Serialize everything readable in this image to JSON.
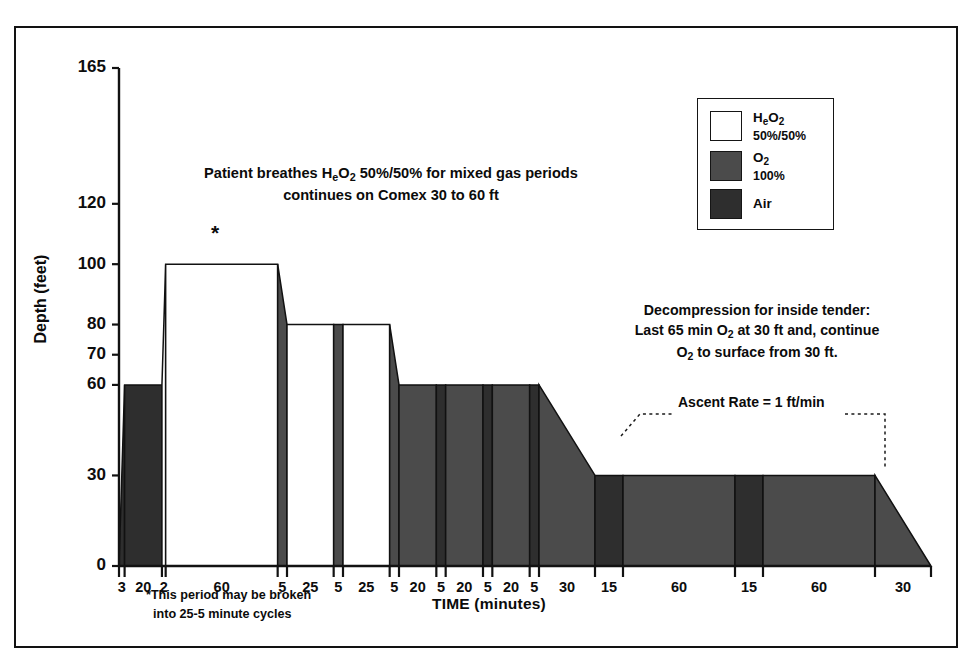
{
  "figure": {
    "background": "#ffffff",
    "border_color": "#121212"
  },
  "axes": {
    "y_title": "Depth (feet)",
    "x_title": "TIME (minutes)",
    "y_ticks": [
      0,
      30,
      60,
      70,
      80,
      100,
      120,
      165
    ],
    "y_min": 0,
    "y_max": 165
  },
  "legend": {
    "items": [
      {
        "name": "HeO2",
        "label_main": "H",
        "label_sub": "e",
        "label_main2": "O",
        "label_sub2": "2",
        "percent": "50%/50%",
        "color": "#ffffff"
      },
      {
        "name": "O2",
        "label_main": "O",
        "label_sub2": "2",
        "percent": "100%",
        "color": "#4b4b4b"
      },
      {
        "name": "Air",
        "label_main": "Air",
        "percent": "",
        "color": "#2e2e2e"
      }
    ]
  },
  "annotations": {
    "mixed_gas_line1": "Patient breathes H",
    "mixed_gas_line1_sub": "e",
    "mixed_gas_line1_b": "O",
    "mixed_gas_line1_sub2": "2",
    "mixed_gas_line1_c": " 50%/50% for mixed gas periods",
    "mixed_gas_line2": "continues on Comex 30 to 60 ft",
    "decomp_line1": "Decompression for inside tender:",
    "decomp_line2a": "Last 65 min O",
    "decomp_line2sub": "2",
    "decomp_line2b": " at 30 ft and, continue",
    "decomp_line3a": "O",
    "decomp_line3sub": "2",
    "decomp_line3b": " to surface from 30 ft.",
    "ascent_rate": "Ascent Rate = 1 ft/min",
    "footnote_line1": "This period may be broken",
    "footnote_line2": "into 25-5 minute cycles",
    "star": "*"
  },
  "chart_data": {
    "type": "area",
    "xlabel": "TIME (minutes)",
    "ylabel": "Depth (feet)",
    "ylim": [
      0,
      165
    ],
    "grid": false,
    "legend_position": "top-right",
    "colors": {
      "HeO2": "#ffffff",
      "O2": "#4b4b4b",
      "Air": "#2e2e2e"
    },
    "x_tick_labels": [
      "3",
      "20",
      "2",
      "60",
      "5",
      "25",
      "5",
      "25",
      "5",
      "20",
      "5",
      "20",
      "5",
      "20",
      "5",
      "30",
      "15",
      "60",
      "15",
      "60",
      "30"
    ],
    "segments": [
      {
        "label": "3",
        "duration": 3,
        "gas": "Air",
        "depth_start": 0,
        "depth_end": 60,
        "shape": "ramp"
      },
      {
        "label": "20",
        "duration": 20,
        "gas": "Air",
        "depth_start": 60,
        "depth_end": 60,
        "shape": "flat"
      },
      {
        "label": "2",
        "duration": 2,
        "gas": "HeO2",
        "depth_start": 60,
        "depth_end": 100,
        "shape": "ramp"
      },
      {
        "label": "60",
        "duration": 60,
        "gas": "HeO2",
        "depth_start": 100,
        "depth_end": 100,
        "shape": "flat"
      },
      {
        "label": "5",
        "duration": 5,
        "gas": "O2",
        "depth_start": 100,
        "depth_end": 80,
        "shape": "ramp"
      },
      {
        "label": "25",
        "duration": 25,
        "gas": "HeO2",
        "depth_start": 80,
        "depth_end": 80,
        "shape": "flat"
      },
      {
        "label": "5",
        "duration": 5,
        "gas": "O2",
        "depth_start": 80,
        "depth_end": 80,
        "shape": "flat"
      },
      {
        "label": "25",
        "duration": 25,
        "gas": "HeO2",
        "depth_start": 80,
        "depth_end": 80,
        "shape": "flat"
      },
      {
        "label": "5",
        "duration": 5,
        "gas": "O2",
        "depth_start": 80,
        "depth_end": 60,
        "shape": "ramp"
      },
      {
        "label": "20",
        "duration": 20,
        "gas": "O2",
        "depth_start": 60,
        "depth_end": 60,
        "shape": "flat"
      },
      {
        "label": "5",
        "duration": 5,
        "gas": "Air",
        "depth_start": 60,
        "depth_end": 60,
        "shape": "flat"
      },
      {
        "label": "20",
        "duration": 20,
        "gas": "O2",
        "depth_start": 60,
        "depth_end": 60,
        "shape": "flat"
      },
      {
        "label": "5",
        "duration": 5,
        "gas": "Air",
        "depth_start": 60,
        "depth_end": 60,
        "shape": "flat"
      },
      {
        "label": "20",
        "duration": 20,
        "gas": "O2",
        "depth_start": 60,
        "depth_end": 60,
        "shape": "flat"
      },
      {
        "label": "5",
        "duration": 5,
        "gas": "Air",
        "depth_start": 60,
        "depth_end": 60,
        "shape": "flat"
      },
      {
        "label": "30",
        "duration": 30,
        "gas": "O2",
        "depth_start": 60,
        "depth_end": 30,
        "shape": "ramp"
      },
      {
        "label": "15",
        "duration": 15,
        "gas": "Air",
        "depth_start": 30,
        "depth_end": 30,
        "shape": "flat"
      },
      {
        "label": "60",
        "duration": 60,
        "gas": "O2",
        "depth_start": 30,
        "depth_end": 30,
        "shape": "flat"
      },
      {
        "label": "15",
        "duration": 15,
        "gas": "Air",
        "depth_start": 30,
        "depth_end": 30,
        "shape": "flat"
      },
      {
        "label": "60",
        "duration": 60,
        "gas": "O2",
        "depth_start": 30,
        "depth_end": 30,
        "shape": "flat"
      },
      {
        "label": "30",
        "duration": 30,
        "gas": "O2",
        "depth_start": 30,
        "depth_end": 0,
        "shape": "ramp"
      }
    ]
  }
}
